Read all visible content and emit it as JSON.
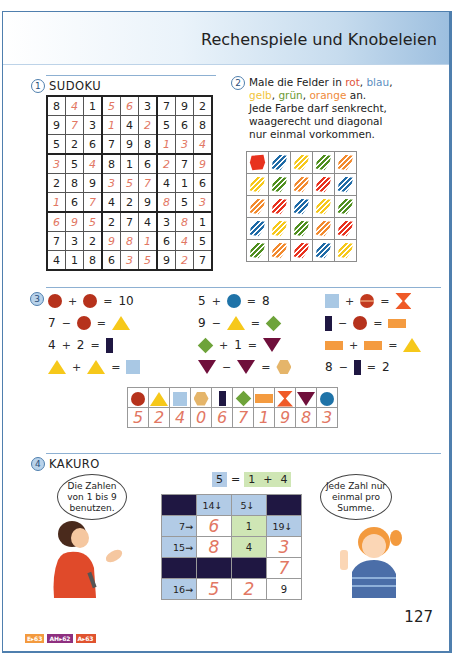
{
  "header": {
    "title": "Rechenspiele und Knobeleien"
  },
  "section1": {
    "number": "1",
    "title": "SUDOKU",
    "grid": [
      [
        "8",
        "4",
        "1",
        "5",
        "6",
        "3",
        "7",
        "9",
        "2"
      ],
      [
        "9",
        "7",
        "3",
        "1",
        "4",
        "2",
        "5",
        "6",
        "8"
      ],
      [
        "5",
        "2",
        "6",
        "7",
        "9",
        "8",
        "1",
        "3",
        "4"
      ],
      [
        "3",
        "5",
        "4",
        "8",
        "1",
        "6",
        "2",
        "7",
        "9"
      ],
      [
        "2",
        "8",
        "9",
        "3",
        "5",
        "7",
        "4",
        "1",
        "6"
      ],
      [
        "1",
        "6",
        "7",
        "4",
        "2",
        "9",
        "8",
        "5",
        "3"
      ],
      [
        "6",
        "9",
        "5",
        "2",
        "7",
        "4",
        "3",
        "8",
        "1"
      ],
      [
        "7",
        "3",
        "2",
        "9",
        "8",
        "1",
        "6",
        "4",
        "5"
      ],
      [
        "4",
        "1",
        "8",
        "6",
        "3",
        "5",
        "9",
        "2",
        "7"
      ]
    ],
    "filled_mask": [
      [
        0,
        1,
        0,
        1,
        1,
        0,
        0,
        0,
        0
      ],
      [
        0,
        1,
        0,
        1,
        0,
        1,
        0,
        0,
        0
      ],
      [
        0,
        0,
        0,
        0,
        0,
        0,
        1,
        1,
        1
      ],
      [
        1,
        0,
        1,
        0,
        0,
        0,
        1,
        0,
        1
      ],
      [
        0,
        0,
        0,
        1,
        1,
        1,
        0,
        0,
        0
      ],
      [
        1,
        0,
        1,
        0,
        0,
        0,
        1,
        0,
        1
      ],
      [
        1,
        1,
        1,
        0,
        0,
        0,
        0,
        1,
        0
      ],
      [
        0,
        0,
        0,
        1,
        1,
        1,
        0,
        1,
        0
      ],
      [
        0,
        0,
        0,
        0,
        1,
        1,
        0,
        1,
        0
      ]
    ]
  },
  "section2": {
    "number": "2",
    "line1_prefix": "Male die Felder in ",
    "color_rot": "rot",
    "comma1": ", ",
    "color_blau": "blau",
    "comma2": ",",
    "color_gelb": "gelb",
    "comma3": ", ",
    "color_gruen": "grün",
    "comma4": ", ",
    "color_orange": "orange",
    "line2_suffix": " an.",
    "line3": "Jede Farbe darf senkrecht,",
    "line4": "waagerecht und diagonal",
    "line5": "nur einmal vorkommen.",
    "colors": {
      "rot": "#e8321e",
      "blau": "#1e6aa6",
      "gelb": "#f6c81a",
      "gruen": "#4f8f1e",
      "orange": "#f28a2e"
    },
    "grid": [
      [
        "rot",
        "blau",
        "gelb",
        "gruen",
        "orange"
      ],
      [
        "gelb",
        "gruen",
        "orange",
        "rot",
        "blau"
      ],
      [
        "orange",
        "rot",
        "blau",
        "gelb",
        "gruen"
      ],
      [
        "blau",
        "gelb",
        "gruen",
        "orange",
        "rot"
      ],
      [
        "gruen",
        "orange",
        "rot",
        "blau",
        "gelb"
      ]
    ]
  },
  "section3": {
    "number": "3",
    "col1": [
      {
        "a": "circle-red",
        "op1": "+",
        "b": "circle-red",
        "eq": "=",
        "c": "10"
      },
      {
        "a": "7",
        "op1": "−",
        "b": "circle-red",
        "eq": "=",
        "c": "tri-yellow"
      },
      {
        "a": "4",
        "op1": "+",
        "b": "2",
        "eq": "=",
        "c": "rect-navy"
      },
      {
        "a": "tri-yellow",
        "op1": "+",
        "b": "tri-yellow",
        "eq": "=",
        "c": "sq-lblue"
      }
    ],
    "col2": [
      {
        "a": "5",
        "op1": "+",
        "b": "circle-blue",
        "eq": "=",
        "c": "8"
      },
      {
        "a": "9",
        "op1": "−",
        "b": "tri-yellow",
        "eq": "=",
        "c": "dia-green"
      },
      {
        "a": "dia-green",
        "op1": "+",
        "b": "1",
        "eq": "=",
        "c": "tri-down"
      },
      {
        "a": "tri-down",
        "op1": "−",
        "b": "tri-down",
        "eq": "=",
        "c": "hex"
      }
    ],
    "col3": [
      {
        "a": "sq-lblue",
        "op1": "+",
        "b": "circle-split",
        "eq": "=",
        "c": "hourglass"
      },
      {
        "a": "rect-navy",
        "op1": "−",
        "b": "circle-red",
        "eq": "=",
        "c": "bar-orange"
      },
      {
        "a": "bar-orange",
        "op1": "+",
        "b": "bar-orange",
        "eq": "=",
        "c": "tri-yellow"
      },
      {
        "a": "8",
        "op1": "−",
        "b": "rect-navy",
        "eq": "=",
        "c": "2"
      }
    ],
    "key": {
      "shapes": [
        "circle-red",
        "tri-yellow",
        "sq-lblue",
        "hex",
        "rect-navy",
        "dia-green",
        "bar-orange",
        "hourglass",
        "tri-down",
        "circle-blue"
      ],
      "values": [
        "5",
        "2",
        "4",
        "0",
        "6",
        "7",
        "1",
        "9",
        "8",
        "3"
      ]
    }
  },
  "section4": {
    "number": "4",
    "title": "KAKURO",
    "bubble_left": "Die Zahlen von 1 bis 9 benutzen.",
    "bubble_right": "Jede Zahl nur einmal pro Summe.",
    "example": {
      "sum": "5",
      "eq": "=",
      "a": "1",
      "plus": "+",
      "b": "4"
    },
    "grid": [
      [
        {
          "t": "dark"
        },
        {
          "t": "clue-down",
          "v": "14↓"
        },
        {
          "t": "clue-down",
          "v": "5↓"
        },
        {
          "t": "dark"
        }
      ],
      [
        {
          "t": "clue",
          "v": "7→"
        },
        {
          "t": "red",
          "v": "6"
        },
        {
          "t": "green",
          "v": "1"
        },
        {
          "t": "clue-down",
          "v": "19↓"
        }
      ],
      [
        {
          "t": "clue",
          "v": "15→"
        },
        {
          "t": "red",
          "v": "8"
        },
        {
          "t": "green",
          "v": "4"
        },
        {
          "t": "red",
          "v": "3"
        }
      ],
      [
        {
          "t": "dark"
        },
        {
          "t": "dark"
        },
        {
          "t": "dark"
        },
        {
          "t": "red",
          "v": "7"
        }
      ],
      [
        {
          "t": "clue",
          "v": "16→"
        },
        {
          "t": "red",
          "v": "5"
        },
        {
          "t": "red",
          "v": "2"
        },
        {
          "t": "plain",
          "v": "9"
        }
      ]
    ]
  },
  "footer": {
    "page_number": "127",
    "badges": [
      {
        "label": "E▸63",
        "color": "#f39a3e"
      },
      {
        "label": "AH▸62",
        "color": "#8e2f7f"
      },
      {
        "label": "A▸63",
        "color": "#e0532f"
      }
    ]
  }
}
